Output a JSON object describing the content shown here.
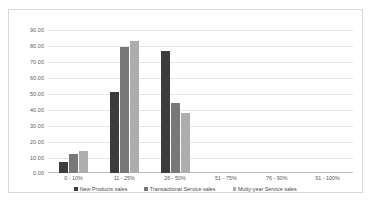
{
  "chart_data": {
    "type": "bar",
    "title": "",
    "xlabel": "",
    "ylabel": "",
    "ylim": [
      0,
      90
    ],
    "ytick_step": 10,
    "grid": true,
    "legend_position": "bottom",
    "categories": [
      "0 - 10%",
      "11 - 25%",
      "26 - 50%",
      "51 - 75%",
      "76 - 90%",
      "91 - 100%"
    ],
    "ytick_labels": [
      "90.00",
      "80.00",
      "70.00",
      "60.00",
      "50.00",
      "40.00",
      "30.00",
      "20.00",
      "10.00",
      "0.00"
    ],
    "series": [
      {
        "name": "New Products sales",
        "color": "#3c3c3c",
        "values": [
          7,
          51,
          77,
          0,
          0,
          0
        ]
      },
      {
        "name": "Transactional Service sales",
        "color": "#787878",
        "values": [
          12,
          79.5,
          44,
          0,
          0,
          0
        ]
      },
      {
        "name": "Multy-year Service sales",
        "color": "#adadad",
        "values": [
          14,
          83,
          38,
          0,
          0,
          0
        ]
      }
    ]
  }
}
